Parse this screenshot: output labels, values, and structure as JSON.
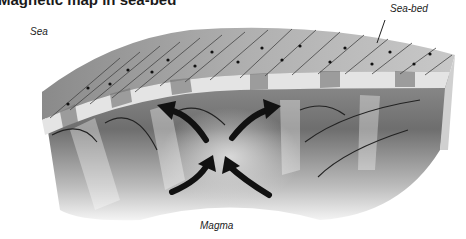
{
  "title": "Magnetic map in sea-bed",
  "labels": {
    "sea": "Sea",
    "sea_bed": "Sea-bed",
    "magma": "Magma"
  },
  "diagram": {
    "type": "cross-section block of sea-floor spreading",
    "elements": [
      "magnetic stripes with arrows on surface",
      "arc field lines",
      "four black arrows showing magma upwelling and spreading"
    ],
    "colors": {
      "arrow": "#111111",
      "block_light": "#e0e0e0",
      "block_dark": "#7a7a7a"
    }
  }
}
